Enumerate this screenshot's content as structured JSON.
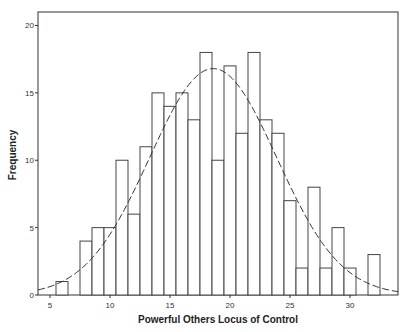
{
  "chart_data": {
    "type": "bar",
    "subtype": "histogram with normal curve",
    "title": "",
    "xlabel": "Powerful Others Locus of Control",
    "ylabel": "Frequency",
    "x": [
      6,
      7,
      8,
      9,
      10,
      11,
      12,
      13,
      14,
      15,
      16,
      17,
      18,
      19,
      20,
      21,
      22,
      23,
      24,
      25,
      26,
      27,
      28,
      29,
      30,
      31,
      32
    ],
    "values": [
      1,
      0,
      4,
      5,
      5,
      10,
      6,
      11,
      15,
      14,
      15,
      13,
      18,
      10,
      17,
      12,
      18,
      13,
      12,
      7,
      2,
      8,
      2,
      5,
      2,
      0,
      3
    ],
    "xlim": [
      4,
      34
    ],
    "ylim": [
      0,
      21
    ],
    "xticks": [
      5,
      10,
      15,
      20,
      25,
      30
    ],
    "yticks": [
      0,
      5,
      10,
      15,
      20
    ],
    "normal_curve": {
      "mean": 18.6,
      "sd": 5.3,
      "peak": 16.8,
      "style": "dashed"
    },
    "grid": false,
    "legend": null,
    "colors": {
      "bar_fill": "#ffffff",
      "bar_stroke": "#444444",
      "curve": "#333333",
      "frame": "#333333"
    }
  }
}
